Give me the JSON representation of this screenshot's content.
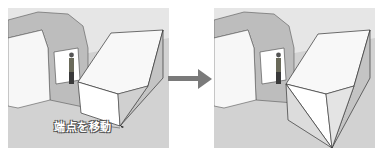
{
  "figure": {
    "before_panel": {
      "label": "端点を移動",
      "description": "box with sloped top, cursor at bottom front corner"
    },
    "after_panel": {
      "description": "box with bottom front corner moved, faces split into triangles"
    },
    "arrow": "right-arrow",
    "colors": {
      "ground": "#cfcfcf",
      "wall": "#bdbdbd",
      "face_light": "#fafafa",
      "face_shade": "#c8c8c8",
      "arrow": "#7a7a7a"
    }
  }
}
